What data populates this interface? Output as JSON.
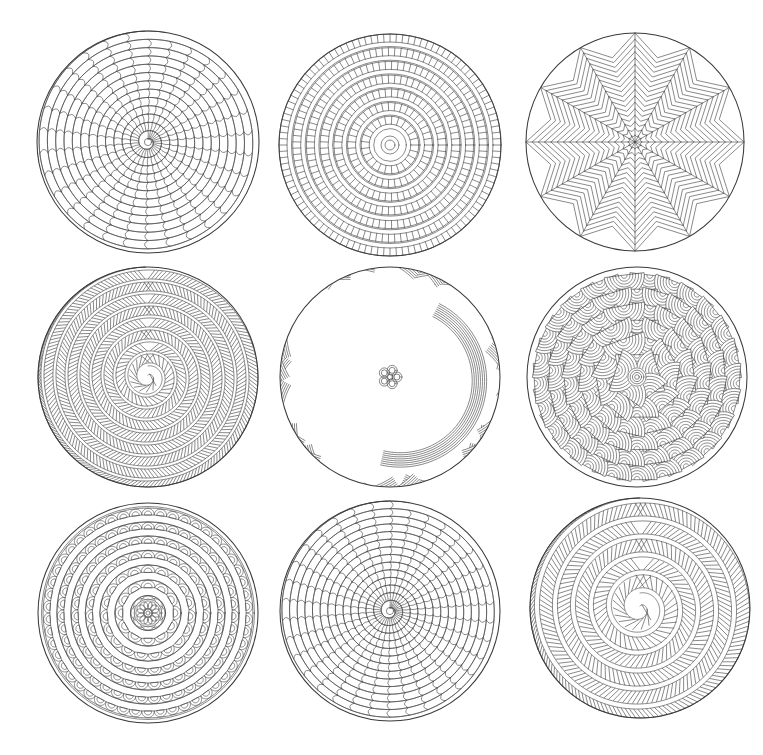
{
  "page": {
    "background_color": "#ffffff",
    "ink_color": "#3c3c3c",
    "width": 763,
    "height": 755,
    "columns": 3,
    "rows": 3,
    "total_mandalas": 9,
    "media": "black line art on white paper",
    "has_text": false
  },
  "mandalas": [
    {
      "index": 1,
      "position": "top-left",
      "name": "spiral-cobblestone-mandala",
      "pattern": "spiral-brick",
      "description": "Archimedean spiral of rounded brick cells radiating from a tight center",
      "center_x": 148,
      "center_y": 142,
      "radius": 111,
      "spiral_turns": 13,
      "cells_per_turn": 30,
      "center_radius": 3
    },
    {
      "index": 2,
      "position": "top-center",
      "name": "concentric-ladder-ring-mandala",
      "pattern": "concentric-ladder-rings",
      "description": "Alternating ticked ladder bands and plain concentric rings around a small core circle",
      "center_x": 390,
      "center_y": 145,
      "radius": 111,
      "ring_count": 9,
      "band_thickness": 8,
      "gap_thickness": 4.5,
      "core_radius": 9
    },
    {
      "index": 3,
      "position": "top-right",
      "name": "radial-chevron-sector-mandala",
      "pattern": "radial-chevron-sectors",
      "description": "Twelve pie sectors, each filled with nested chevrons pointing toward the hub",
      "center_x": 635,
      "center_y": 142,
      "radius": 109,
      "sector_count": 12,
      "chevrons_per_sector": 17
    },
    {
      "index": 4,
      "position": "middle-left",
      "name": "herringbone-spiral-mandala",
      "pattern": "hatched-spiral-band",
      "description": "Wide spiral ribbon filled with slanted herringbone hatching, many turns",
      "center_x": 148,
      "center_y": 377,
      "radius": 110,
      "spiral_turns": 9,
      "band_width": 9,
      "hatch_spacing": 3.6
    },
    {
      "index": 5,
      "position": "middle-center",
      "name": "woven-braid-mandala",
      "pattern": "interlaced-striped-ribbons",
      "description": "Dense interlaced basket-weave of finely striped ribbons with a small flower knot at center",
      "center_x": 390,
      "center_y": 377,
      "radius": 110,
      "ribbon_count": 34,
      "stripes_per_ribbon": 7,
      "center_flower_petals": 5
    },
    {
      "index": 6,
      "position": "middle-right",
      "name": "concentric-arc-scale-mandala",
      "pattern": "overlapping-arc-scales",
      "description": "Overlapping fish-scale petals, each packed with nested concentric arcs, growing outward from a tiny rosette",
      "center_x": 637,
      "center_y": 377,
      "radius": 110,
      "scale_rings": 6,
      "arcs_per_scale": 7
    },
    {
      "index": 7,
      "position": "bottom-left",
      "name": "lotus-petal-mandala",
      "pattern": "nested-scalloped-petal-rings",
      "description": "Classic lotus mandala: concentric rings of scalloped petals and teardrops around a central flower rosette",
      "center_x": 148,
      "center_y": 613,
      "radius": 110,
      "petal_rings": 7,
      "center_flower_petals": 12
    },
    {
      "index": 8,
      "position": "bottom-center",
      "name": "spiral-cobblestone-mandala-dense",
      "pattern": "spiral-brick",
      "description": "Archimedean spiral of rounded brick cells, denser than the top-left variant",
      "center_x": 390,
      "center_y": 611,
      "radius": 110,
      "spiral_turns": 14,
      "cells_per_turn": 34,
      "center_radius": 3
    },
    {
      "index": 9,
      "position": "bottom-right",
      "name": "herringbone-spiral-mandala-wide",
      "pattern": "hatched-spiral-band",
      "description": "Spiral ribbon with slanted hatch fill, wider bands and fewer turns",
      "center_x": 640,
      "center_y": 608,
      "radius": 110,
      "spiral_turns": 6,
      "band_width": 13,
      "hatch_spacing": 4.2
    }
  ]
}
